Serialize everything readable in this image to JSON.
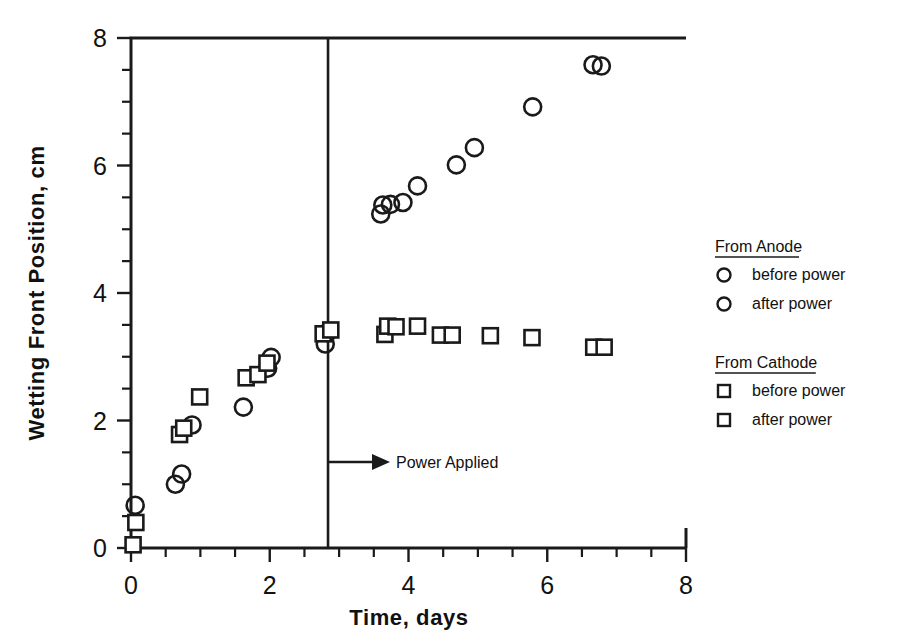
{
  "chart_data": {
    "type": "scatter",
    "title": "",
    "xlabel": "Time,  days",
    "ylabel": "Wetting Front Position, cm",
    "xlim": [
      0,
      8
    ],
    "ylim": [
      0,
      8
    ],
    "xticks": [
      0,
      2,
      4,
      6,
      8
    ],
    "yticks": [
      0,
      2,
      4,
      6,
      8
    ],
    "xtick_labels": [
      "0",
      "2",
      "4",
      "6",
      "8"
    ],
    "ytick_labels": [
      "0",
      "2",
      "4",
      "6",
      "8"
    ],
    "minor_tick_step": 0.5,
    "grid": false,
    "legend_position": "right",
    "annotations": [
      {
        "name": "power-applied",
        "label": "Power Applied",
        "x": 2.84,
        "y": 1.35,
        "type": "vertical-line-with-arrow",
        "line_x": 2.84,
        "line_y_range": [
          0,
          8
        ]
      }
    ],
    "series": [
      {
        "name": "From Anode — before power",
        "marker": "circle",
        "group": "anode",
        "phase": "before",
        "points": [
          {
            "x": 0.06,
            "y": 0.67
          },
          {
            "x": 0.64,
            "y": 1.0
          },
          {
            "x": 0.73,
            "y": 1.16
          },
          {
            "x": 0.88,
            "y": 1.93
          },
          {
            "x": 1.62,
            "y": 2.21
          },
          {
            "x": 1.97,
            "y": 2.82
          },
          {
            "x": 2.02,
            "y": 2.99
          },
          {
            "x": 2.8,
            "y": 3.2
          },
          {
            "x": 2.83,
            "y": 3.38
          }
        ]
      },
      {
        "name": "From Anode — after power",
        "marker": "circle",
        "group": "anode",
        "phase": "after",
        "points": [
          {
            "x": 3.6,
            "y": 5.24
          },
          {
            "x": 3.63,
            "y": 5.38
          },
          {
            "x": 3.74,
            "y": 5.39
          },
          {
            "x": 3.92,
            "y": 5.42
          },
          {
            "x": 4.13,
            "y": 5.68
          },
          {
            "x": 4.69,
            "y": 6.01
          },
          {
            "x": 4.95,
            "y": 6.28
          },
          {
            "x": 5.79,
            "y": 6.92
          },
          {
            "x": 6.66,
            "y": 7.58
          },
          {
            "x": 6.78,
            "y": 7.56
          }
        ]
      },
      {
        "name": "From Cathode — before power",
        "marker": "square",
        "group": "cathode",
        "phase": "before",
        "points": [
          {
            "x": 0.03,
            "y": 0.05
          },
          {
            "x": 0.07,
            "y": 0.4
          },
          {
            "x": 0.7,
            "y": 1.78
          },
          {
            "x": 0.76,
            "y": 1.88
          },
          {
            "x": 0.99,
            "y": 2.37
          },
          {
            "x": 1.66,
            "y": 2.67
          },
          {
            "x": 1.83,
            "y": 2.72
          },
          {
            "x": 1.96,
            "y": 2.9
          },
          {
            "x": 2.77,
            "y": 3.36
          },
          {
            "x": 2.88,
            "y": 3.42
          }
        ]
      },
      {
        "name": "From Cathode — after power",
        "marker": "square",
        "group": "cathode",
        "phase": "after",
        "points": [
          {
            "x": 3.66,
            "y": 3.35
          },
          {
            "x": 3.7,
            "y": 3.48
          },
          {
            "x": 3.82,
            "y": 3.47
          },
          {
            "x": 4.13,
            "y": 3.48
          },
          {
            "x": 4.46,
            "y": 3.34
          },
          {
            "x": 4.63,
            "y": 3.34
          },
          {
            "x": 5.18,
            "y": 3.33
          },
          {
            "x": 5.78,
            "y": 3.3
          },
          {
            "x": 6.67,
            "y": 3.15
          },
          {
            "x": 6.82,
            "y": 3.15
          }
        ]
      }
    ]
  },
  "legend": {
    "groups": [
      {
        "heading": "From Anode",
        "marker": "circle",
        "entries": [
          {
            "label": "before power",
            "marker": "circle"
          },
          {
            "label": "after power",
            "marker": "circle"
          }
        ]
      },
      {
        "heading": "From Cathode",
        "marker": "square",
        "entries": [
          {
            "label": "before power",
            "marker": "square"
          },
          {
            "label": "after power",
            "marker": "square"
          }
        ]
      }
    ]
  },
  "colors": {
    "ink": "#1a1a1a",
    "background": "#ffffff"
  }
}
